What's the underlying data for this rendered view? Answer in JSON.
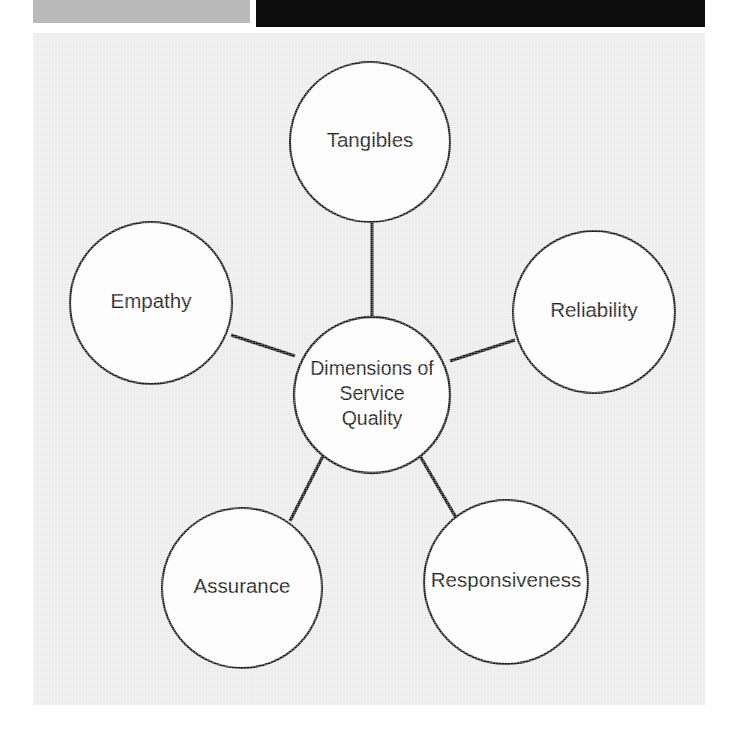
{
  "figure": {
    "panel_color": "#ececec",
    "node_fill": "#fdfdfd",
    "node_stroke": "#1b1b1b",
    "connector_color": "#151515",
    "label_color": "#141414"
  },
  "scan_bars": {
    "gray_bar_color": "#b9b9b9",
    "black_bar_color": "#0c0c0c"
  },
  "chart_data": {
    "type": "diagram",
    "layout": "hub-and-spoke",
    "center": {
      "id": "center",
      "label_lines": [
        "Dimensions of",
        "Service",
        "Quality"
      ],
      "label": "Dimensions of Service Quality",
      "cx": 339,
      "cy": 362,
      "r": 78
    },
    "nodes": [
      {
        "id": "tangibles",
        "label": "Tangibles",
        "cx": 337,
        "cy": 109,
        "r": 80
      },
      {
        "id": "reliability",
        "label": "Reliability",
        "cx": 561,
        "cy": 279,
        "r": 81
      },
      {
        "id": "responsiveness",
        "label": "Responsiveness",
        "cx": 473,
        "cy": 549,
        "r": 82
      },
      {
        "id": "assurance",
        "label": "Assurance",
        "cx": 209,
        "cy": 555,
        "r": 80
      },
      {
        "id": "empathy",
        "label": "Empathy",
        "cx": 118,
        "cy": 270,
        "r": 81
      }
    ],
    "edges": [
      {
        "from": "center",
        "to": "tangibles",
        "x1": 339,
        "y1": 290,
        "x2": 339,
        "y2": 190
      },
      {
        "from": "center",
        "to": "reliability",
        "x1": 417,
        "y1": 328,
        "x2": 482,
        "y2": 307
      },
      {
        "from": "center",
        "to": "responsiveness",
        "x1": 387,
        "y1": 423,
        "x2": 425,
        "y2": 488
      },
      {
        "from": "center",
        "to": "assurance",
        "x1": 290,
        "y1": 423,
        "x2": 257,
        "y2": 488
      },
      {
        "from": "center",
        "to": "empathy",
        "x1": 262,
        "y1": 323,
        "x2": 198,
        "y2": 302
      }
    ]
  }
}
